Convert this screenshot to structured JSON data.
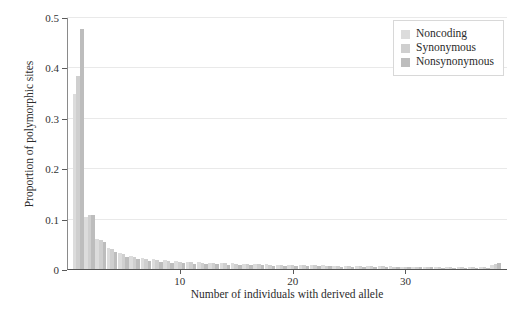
{
  "chart_data": {
    "type": "bar",
    "title": "",
    "subtitle": "",
    "xlabel": "Number of individuals with derived allele",
    "ylabel": "Proportion of polymorphic sites",
    "xlim": [
      0,
      39
    ],
    "ylim": [
      0,
      0.5
    ],
    "xticks": [
      10,
      20,
      30
    ],
    "yticks": [
      0,
      0.1,
      0.2,
      0.3,
      0.4,
      0.5
    ],
    "ytick_labels": [
      "0",
      "0.1",
      "0.2",
      "0.3",
      "0.4",
      "0.5"
    ],
    "xtick_labels": [
      "10",
      "20",
      "30"
    ],
    "grid": "horizontal",
    "legend_position": "top-right",
    "grouping": "grouped",
    "categories": [
      1,
      2,
      3,
      4,
      5,
      6,
      7,
      8,
      9,
      10,
      11,
      12,
      13,
      14,
      15,
      16,
      17,
      18,
      19,
      20,
      21,
      22,
      23,
      24,
      25,
      26,
      27,
      28,
      29,
      30,
      31,
      32,
      33,
      34,
      35,
      36,
      37,
      38
    ],
    "series": [
      {
        "name": "Noncoding",
        "color": "#dcdcdc",
        "values": [
          0.35,
          0.105,
          0.062,
          0.044,
          0.034,
          0.028,
          0.024,
          0.021,
          0.019,
          0.018,
          0.016,
          0.015,
          0.014,
          0.013,
          0.013,
          0.012,
          0.011,
          0.011,
          0.01,
          0.01,
          0.009,
          0.009,
          0.009,
          0.008,
          0.008,
          0.008,
          0.007,
          0.007,
          0.007,
          0.006,
          0.006,
          0.006,
          0.006,
          0.005,
          0.005,
          0.005,
          0.005,
          0.009
        ]
      },
      {
        "name": "Synonymous",
        "color": "#cfcfcf",
        "values": [
          0.385,
          0.11,
          0.06,
          0.042,
          0.032,
          0.026,
          0.022,
          0.02,
          0.018,
          0.016,
          0.015,
          0.014,
          0.013,
          0.013,
          0.012,
          0.011,
          0.011,
          0.01,
          0.01,
          0.009,
          0.009,
          0.009,
          0.008,
          0.008,
          0.008,
          0.007,
          0.007,
          0.007,
          0.006,
          0.006,
          0.006,
          0.006,
          0.005,
          0.005,
          0.005,
          0.005,
          0.005,
          0.011
        ]
      },
      {
        "name": "Nonsynonymous",
        "color": "#bdbdbd",
        "values": [
          0.478,
          0.11,
          0.055,
          0.036,
          0.026,
          0.021,
          0.018,
          0.016,
          0.014,
          0.013,
          0.012,
          0.011,
          0.011,
          0.01,
          0.01,
          0.009,
          0.009,
          0.008,
          0.008,
          0.008,
          0.007,
          0.007,
          0.007,
          0.006,
          0.006,
          0.006,
          0.006,
          0.005,
          0.005,
          0.005,
          0.005,
          0.005,
          0.004,
          0.004,
          0.004,
          0.004,
          0.004,
          0.013
        ]
      }
    ]
  },
  "axes": {
    "ylabel": "Proportion of polymorphic sites",
    "xlabel": "Number of individuals with derived allele"
  },
  "legend": {
    "items": [
      {
        "label": "Noncoding",
        "color": "#dcdcdc"
      },
      {
        "label": "Synonymous",
        "color": "#cfcfcf"
      },
      {
        "label": "Nonsynonymous",
        "color": "#bdbdbd"
      }
    ]
  }
}
